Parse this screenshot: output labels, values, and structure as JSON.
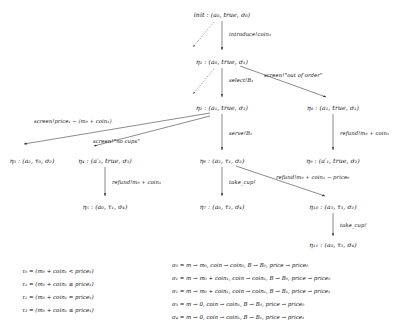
{
  "figure": {
    "nodes": [
      {
        "id": "init",
        "label": "init : (a₀, true, σ₀)",
        "x": 222,
        "y": 14
      },
      {
        "id": "eta1",
        "label": "η₁ : (a₀, true, σ₁)",
        "x": 199,
        "y": 61
      },
      {
        "id": "eta2",
        "label": "η₂ : (a₁, true, σ₁)",
        "x": 196,
        "y": 107
      },
      {
        "id": "eta8",
        "label": "η₈ : (a₁, true, σ₁)",
        "x": 329,
        "y": 107
      },
      {
        "id": "eta3",
        "label": "η₃ : (a₂, τ₀, σ₂)",
        "x": 32,
        "y": 160
      },
      {
        "id": "eta4",
        "label": "η₄ : (a′₂, true, σ₃)",
        "x": 103,
        "y": 160
      },
      {
        "id": "eta6",
        "label": "η₆ : (a₃, τ₁, σ₂)",
        "x": 196,
        "y": 160
      },
      {
        "id": "eta9",
        "label": "η₉ : (a′₁, true, σ₂)",
        "x": 329,
        "y": 160
      },
      {
        "id": "eta5",
        "label": "η₅ : (a₀, τ₁, σ₄)",
        "x": 103,
        "y": 206
      },
      {
        "id": "eta7",
        "label": "η₇ : (a₀, τ₂, σ₄)",
        "x": 196,
        "y": 206
      },
      {
        "id": "eta10",
        "label": "η₁₀ : (a₃, τ₃, σ₂)",
        "x": 330,
        "y": 206
      },
      {
        "id": "eta11",
        "label": "η₁₁ : (a₀, τ₃, σ₄)",
        "x": 330,
        "y": 244
      }
    ],
    "edge_labels": [
      {
        "id": "introduce",
        "text": "introduce!coin₁",
        "x": 229,
        "y": 34
      },
      {
        "id": "select",
        "text": "select!B₁",
        "x": 229,
        "y": 81
      },
      {
        "id": "out-of-order",
        "text": "screen!“out of order”",
        "x": 266,
        "y": 76
      },
      {
        "id": "price-diff",
        "text": "screen!price₁ − (m₀ + coin₁)",
        "x": 38,
        "y": 122
      },
      {
        "id": "no-cups",
        "text": "screen!“no cups”",
        "x": 94,
        "y": 141
      },
      {
        "id": "serve",
        "text": "serve!B₁",
        "x": 205,
        "y": 134
      },
      {
        "id": "refund-right",
        "text": "refund!m₀ + coin₁",
        "x": 339,
        "y": 134
      },
      {
        "id": "refund-left",
        "text": "refund!m₀ + coin₁",
        "x": 112,
        "y": 183
      },
      {
        "id": "take-cup-1",
        "text": "take_cup!",
        "x": 205,
        "y": 183
      },
      {
        "id": "refund-price",
        "text": "refund!m₀ + coin₁ − price₀",
        "x": 280,
        "y": 178
      },
      {
        "id": "take-cup-2",
        "text": "take_cup!",
        "x": 339,
        "y": 226
      }
    ],
    "tau_definitions": [
      "τ₀ = (m₀ + coin₁ < price₁)",
      "τ₁ = (m₀ + coin₁ ≥ price₁)",
      "τ₂ = (m₀ + coin₁ = price₁)",
      "τ₃ = (m₀ + coin₁ ≤ price₁)"
    ],
    "sigma_definitions": [
      "σ₀ = m → m₀, coin → coin₀, B → B₀, price → price₀",
      "σ₁ = m → m₀ + coin₁, coin → coin₁, B → B₀, price → price₀",
      "σ₂ = m → m₀ + coin₁, coin → coin₁, B → B₁, price → price₁",
      "σ₃ = m → 0, coin → coin₁, B → B₀, price → price₀",
      "σ₄ = m → 0, coin → coin₁, B → B₁, price → price₁"
    ]
  }
}
